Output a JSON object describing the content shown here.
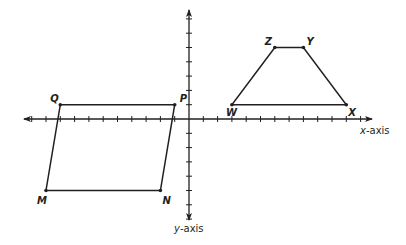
{
  "figure": {
    "x_axis_label_var": "x",
    "x_axis_label_suffix": "-axis",
    "y_axis_label_var": "y",
    "y_axis_label_suffix": "-axis",
    "line_color": "#231f20",
    "background": "#ffffff"
  },
  "grid": {
    "origin_px": [
      189,
      119
    ],
    "unit_px": 14.3,
    "x_ticks": [
      -11,
      -10,
      -9,
      -8,
      -7,
      -6,
      -5,
      -4,
      -3,
      -2,
      -1,
      1,
      2,
      3,
      4,
      5,
      6,
      7,
      8,
      9,
      10,
      11,
      12
    ],
    "y_ticks": [
      -7,
      -6,
      -5,
      -4,
      -3,
      -2,
      -1,
      1,
      2,
      3,
      4,
      5,
      6,
      7
    ]
  },
  "shapes": [
    {
      "name": "parallelogram-MNPQ",
      "vertices": [
        {
          "label": "Q",
          "x": -9,
          "y": 1
        },
        {
          "label": "P",
          "x": -1,
          "y": 1
        },
        {
          "label": "N",
          "x": -2,
          "y": -5
        },
        {
          "label": "M",
          "x": -10,
          "y": -5
        }
      ]
    },
    {
      "name": "trapezoid-WXYZ",
      "vertices": [
        {
          "label": "W",
          "x": 3,
          "y": 1
        },
        {
          "label": "X",
          "x": 11,
          "y": 1
        },
        {
          "label": "Y",
          "x": 8,
          "y": 5
        },
        {
          "label": "Z",
          "x": 6,
          "y": 5
        }
      ]
    }
  ],
  "labels": {
    "Q": "Q",
    "P": "P",
    "N": "N",
    "M": "M",
    "W": "W",
    "X": "X",
    "Y": "Y",
    "Z": "Z"
  }
}
